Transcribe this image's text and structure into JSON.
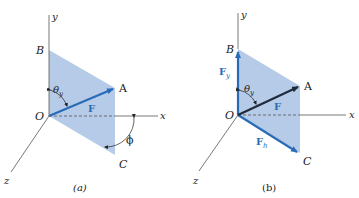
{
  "figure_a": {
    "caption": "(a)",
    "labels": {
      "y_axis": "y",
      "x_axis": "x",
      "z_axis": "z",
      "origin": "O",
      "point_a": "A",
      "point_b": "B",
      "point_c": "C",
      "force": "F",
      "theta": "θ",
      "theta_sub": "y",
      "phi": "ϕ"
    }
  },
  "figure_b": {
    "caption": "(b)",
    "labels": {
      "y_axis": "y",
      "x_axis": "x",
      "z_axis": "z",
      "origin": "O",
      "point_a": "A",
      "point_b": "B",
      "point_c": "C",
      "force": "F",
      "force_y": "F",
      "force_y_sub": "y",
      "force_h": "F",
      "force_h_sub": "h",
      "theta": "θ",
      "theta_sub": "y"
    }
  },
  "colors": {
    "plane_fill": "#a9c2e3",
    "vector_blue": "#2a6bb8",
    "vector_dark": "#1f2a3a",
    "axis": "#555555"
  }
}
